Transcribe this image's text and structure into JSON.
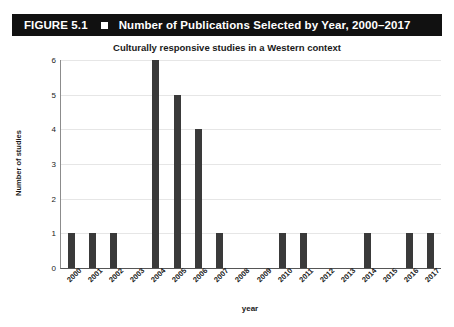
{
  "banner": {
    "figure_number": "FIGURE 5.1",
    "bullet_icon": "square-bullet-icon",
    "title": "Number of Publications Selected by Year, 2000–2017",
    "background_color": "#111111",
    "text_color": "#ffffff"
  },
  "chart_data": {
    "type": "bar",
    "title": "Culturally responsive studies in a Western context",
    "xlabel": "year",
    "ylabel": "Number of studies",
    "categories": [
      "2000",
      "2001",
      "2002",
      "2003",
      "2004",
      "2005",
      "2006",
      "2007",
      "2008",
      "2009",
      "2010",
      "2011",
      "2012",
      "2013",
      "2014",
      "2015",
      "2016",
      "2017"
    ],
    "values": [
      1,
      1,
      1,
      0,
      6,
      5,
      4,
      1,
      0,
      0,
      1,
      1,
      0,
      0,
      1,
      0,
      1,
      1
    ],
    "ylim": [
      0,
      6
    ],
    "yticks": [
      0,
      1,
      2,
      3,
      4,
      5,
      6
    ],
    "ytick_labels": [
      "0",
      "1",
      "2",
      "3",
      "4",
      "5",
      "6"
    ],
    "grid": true,
    "grid_axis": "y",
    "legend": false,
    "bar_color": "#3a3a3a",
    "gridline_color": "#e6e6e6",
    "axis_color": "#555555"
  }
}
